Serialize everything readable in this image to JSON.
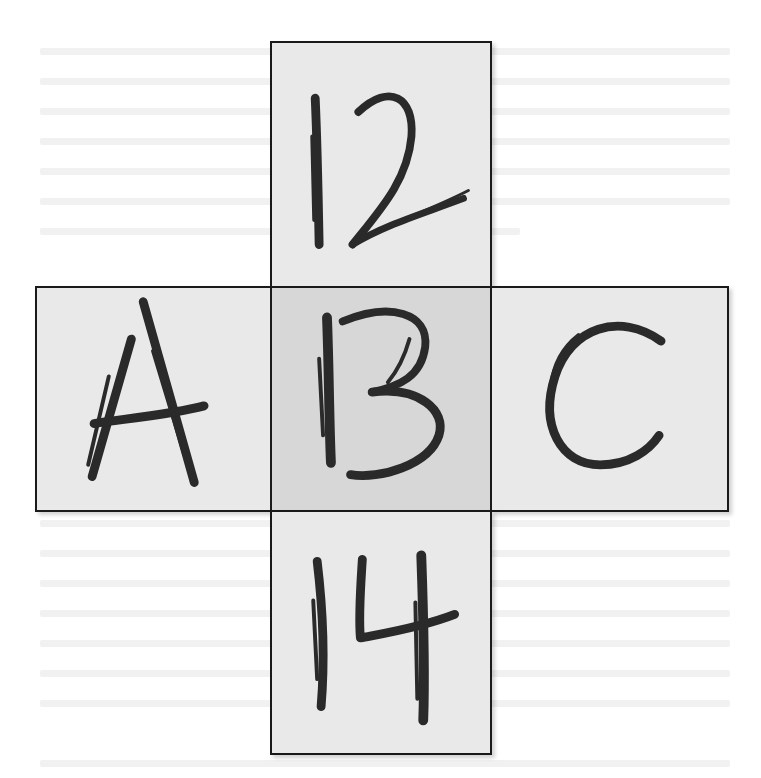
{
  "figure": {
    "cells": {
      "top": {
        "label": "12"
      },
      "left": {
        "label": "A"
      },
      "center": {
        "label": "B",
        "alt_reading": "13"
      },
      "right": {
        "label": "C"
      },
      "bottom": {
        "label": "14"
      }
    },
    "vertical_sequence": [
      "12",
      "13",
      "14"
    ],
    "horizontal_sequence": [
      "A",
      "B",
      "C"
    ],
    "colors": {
      "outer_fill": "#e9e9e9",
      "center_fill": "#d7d7d7",
      "border": "#1a1a1a",
      "ink": "#2a2a2a"
    }
  }
}
